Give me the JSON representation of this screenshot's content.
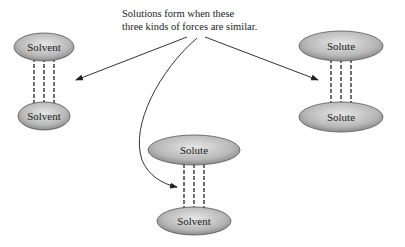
{
  "caption": {
    "line1": "Solutions form when these",
    "line2": "three kinds of forces are similar."
  },
  "pairs": {
    "left": {
      "top": "Solvent",
      "bottom": "Solvent"
    },
    "right": {
      "top": "Solute",
      "bottom": "Solute"
    },
    "middle": {
      "top": "Solute",
      "bottom": "Solvent"
    }
  },
  "colors": {
    "ellipse_light": "#e2e2e2",
    "ellipse_dark": "#8f8f8f",
    "stroke": "#333333"
  }
}
